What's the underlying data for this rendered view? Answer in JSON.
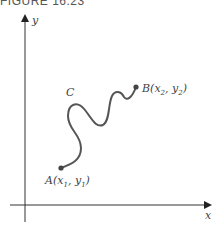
{
  "figure": {
    "title": "FIGURE 16.23",
    "x_axis_label": "x",
    "y_axis_label": "y",
    "curve_label": "C",
    "point_a": {
      "name": "A",
      "label": "A(x",
      "sub1": "1",
      "mid": ", y",
      "sub2": "1",
      "end": ")"
    },
    "point_b": {
      "name": "B",
      "label": "B(x",
      "sub1": "2",
      "mid": ", y",
      "sub2": "2",
      "end": ")"
    },
    "colors": {
      "axis": "#333333",
      "curve": "#555555",
      "text": "#444444"
    }
  }
}
